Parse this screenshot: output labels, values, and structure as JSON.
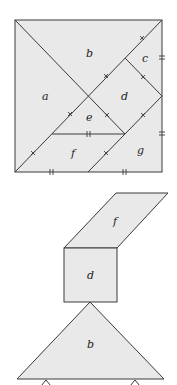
{
  "figure": {
    "colors": {
      "fill": "#e9e9e9",
      "stroke": "#3a3a3a",
      "text": "#222222"
    },
    "top_square": {
      "labels": {
        "a": "a",
        "b": "b",
        "c": "c",
        "d": "d",
        "e": "e",
        "f": "f",
        "g": "g"
      }
    },
    "bottom_figure": {
      "labels": {
        "f": "f",
        "d": "d",
        "b": "b"
      }
    }
  }
}
